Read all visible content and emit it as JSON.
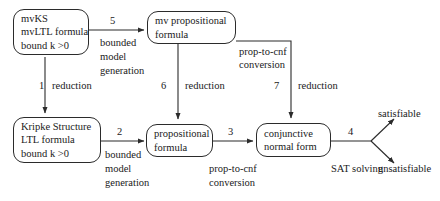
{
  "diagram": {
    "stroke_color": "#2b2b2b",
    "text_color": "#1a1a1a",
    "background": "#ffffff",
    "nodes": [
      {
        "id": "mvks",
        "lines": [
          "mvKS",
          "mvLTL formula",
          "bound k >0"
        ]
      },
      {
        "id": "mv-prop",
        "lines": [
          "mv propositional",
          "formula"
        ]
      },
      {
        "id": "kripke",
        "lines": [
          "Kripke Structure",
          "LTL formula",
          "bound k >0"
        ]
      },
      {
        "id": "prop",
        "lines": [
          "propositional",
          "formula"
        ]
      },
      {
        "id": "cnf",
        "lines": [
          "conjunctive",
          "normal form"
        ]
      }
    ],
    "edges": [
      {
        "id": "edge-5",
        "number": "5",
        "label_lines": [
          "bounded",
          "model",
          "generation"
        ]
      },
      {
        "id": "edge-1",
        "number": "1",
        "label_lines": [
          "reduction"
        ]
      },
      {
        "id": "edge-6",
        "number": "6",
        "label_lines": [
          "reduction"
        ]
      },
      {
        "id": "edge-7",
        "number": "7",
        "label_lines": [
          "reduction"
        ]
      },
      {
        "id": "edge-7-source",
        "number": "",
        "label_lines": [
          "prop-to-cnf",
          "conversion"
        ]
      },
      {
        "id": "edge-2",
        "number": "2",
        "label_lines": [
          "bounded",
          "model",
          "generation"
        ]
      },
      {
        "id": "edge-3",
        "number": "3",
        "label_lines": [
          "prop-to-cnf",
          "conversion"
        ]
      },
      {
        "id": "edge-4",
        "number": "4",
        "label_lines": [
          "SAT solving"
        ]
      }
    ],
    "outcomes": [
      {
        "id": "satisfiable",
        "label": "satisfiable"
      },
      {
        "id": "unsatisfiable",
        "label": "unsatisfiable"
      }
    ]
  }
}
